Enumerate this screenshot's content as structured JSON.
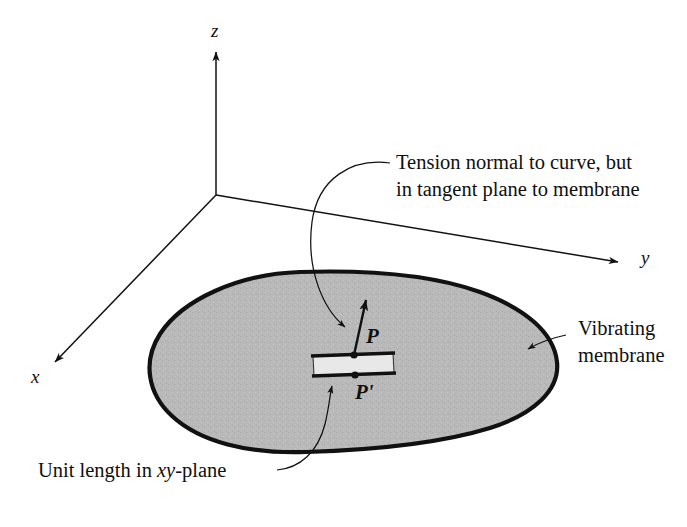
{
  "figure": {
    "background_color": "#ffffff",
    "membrane_fill": "#b9b9b9",
    "ink_color": "#111111"
  },
  "axes": {
    "z_label": "z",
    "y_label": "y",
    "x_label": "x",
    "origin": {
      "x": 216,
      "y": 195
    }
  },
  "points": {
    "p_label": "P",
    "p_prime_label": "P'"
  },
  "annotations": {
    "tension_line1": "Tension normal to curve, but",
    "tension_line2": "in tangent plane to membrane",
    "membrane_line1": "Vibrating",
    "membrane_line2": "membrane",
    "unit_length_prefix": "Unit length in ",
    "unit_length_italic": "xy",
    "unit_length_suffix": "-plane"
  }
}
